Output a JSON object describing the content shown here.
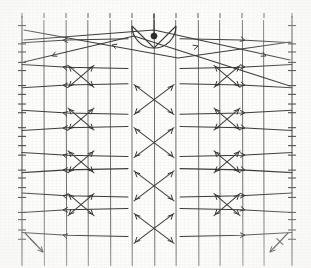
{
  "figure": {
    "width": 311,
    "height": 268,
    "background_color": "#fdfdfc",
    "ink_color": "#3a3a3a",
    "grid_color": "#5d5d5d",
    "node_color": "#2a2a2a"
  },
  "chart_data": {
    "type": "diagram",
    "xlabel": "",
    "ylabel": "",
    "grid": true,
    "legend": "none",
    "plot_area": {
      "x0": 22,
      "y0": 20,
      "x1": 292,
      "y1": 252
    },
    "vertical_grid_lines_count": 13,
    "vertical_grid_x": [
      22,
      44,
      66,
      88,
      110,
      132,
      154,
      176,
      198,
      220,
      242,
      264,
      292
    ],
    "horizontal_rows_count": 10,
    "horizontal_row_y": [
      43,
      64,
      88,
      110,
      131,
      152,
      173,
      193,
      212,
      233
    ],
    "left_axis_tick_y": [
      26,
      44,
      52,
      62,
      71,
      86,
      94,
      104,
      113,
      128,
      136,
      146,
      155,
      170,
      178,
      188,
      197,
      212,
      220,
      230,
      239
    ],
    "right_axis_tick_y": [
      26,
      44,
      52,
      62,
      71,
      86,
      94,
      104,
      113,
      128,
      136,
      146,
      155,
      170,
      178,
      188,
      197,
      212,
      220,
      230,
      239
    ],
    "top_tick_x": [
      22,
      44,
      66,
      88,
      110,
      132,
      154,
      176,
      198,
      220,
      242,
      264,
      292
    ],
    "center_arc": {
      "cx": 154,
      "cy": 26,
      "r": 22,
      "start_angle_deg": 0,
      "end_angle_deg": 180
    },
    "center_node": {
      "x": 154,
      "y": 36,
      "r": 3.1
    },
    "center_crossings_x": 154,
    "center_crossing_y": [
      100,
      143,
      186,
      228
    ],
    "left_crossings_x": 81,
    "left_crossing_y": [
      76,
      119,
      162,
      205
    ],
    "right_crossings_x": 227,
    "right_crossing_y": [
      76,
      119,
      162,
      205
    ],
    "corner_marks": [
      {
        "name": "bottom-left-arrow",
        "x1": 25,
        "y1": 233,
        "x2": 43,
        "y2": 252
      },
      {
        "name": "bottom-right-arrow",
        "x1": 288,
        "y1": 233,
        "x2": 270,
        "y2": 252
      }
    ],
    "arrowheads_total": 64
  },
  "elements": {
    "plot_frame_label": "plot-frame",
    "left_axis_label": "left-axis",
    "right_axis_label": "right-axis",
    "arc_label": "center-arc",
    "node_label": "center-node"
  }
}
